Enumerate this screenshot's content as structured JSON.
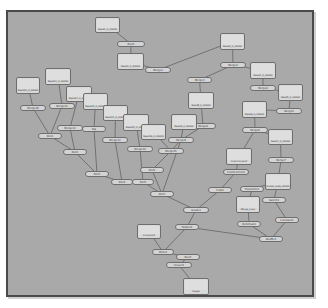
{
  "graph": {
    "title": "Node Graph",
    "background": "#a9a9a9",
    "node_fill": "#d6d6d6",
    "node_border": "#6e6e6e",
    "edge_color": "#5a5a5a",
    "nodes": [
      {
        "id": "r1",
        "type": "read",
        "label": "Read1_0_00000",
        "x": 95,
        "y": 17,
        "w": 25,
        "h": 16
      },
      {
        "id": "o1",
        "type": "op",
        "label": "Blur1",
        "x": 117,
        "y": 41,
        "w": 28,
        "h": 6
      },
      {
        "id": "r2",
        "type": "read",
        "label": "Read2_0_00000",
        "x": 117,
        "y": 53,
        "w": 27,
        "h": 17
      },
      {
        "id": "o2",
        "type": "op",
        "label": "Merge1",
        "x": 145,
        "y": 67,
        "w": 26,
        "h": 6
      },
      {
        "id": "r3",
        "type": "read",
        "label": "Read3_0_00000",
        "x": 220,
        "y": 33,
        "w": 25,
        "h": 17
      },
      {
        "id": "o3",
        "type": "op",
        "label": "Merge2",
        "x": 220,
        "y": 62,
        "w": 26,
        "h": 6
      },
      {
        "id": "o4",
        "type": "op",
        "label": "Merge3",
        "x": 187,
        "y": 77,
        "w": 25,
        "h": 6
      },
      {
        "id": "r4",
        "type": "read",
        "label": "Read4_0_00000",
        "x": 250,
        "y": 62,
        "w": 26,
        "h": 17
      },
      {
        "id": "o5",
        "type": "op",
        "label": "Merge4",
        "x": 250,
        "y": 85,
        "w": 26,
        "h": 6
      },
      {
        "id": "r5",
        "type": "read",
        "label": "Read5_0_00000",
        "x": 278,
        "y": 84,
        "w": 25,
        "h": 17
      },
      {
        "id": "o6",
        "type": "op",
        "label": "Merge5",
        "x": 276,
        "y": 108,
        "w": 26,
        "h": 6
      },
      {
        "id": "r6",
        "type": "read",
        "label": "Read6_0_00000",
        "x": 242,
        "y": 101,
        "w": 25,
        "h": 17
      },
      {
        "id": "o7",
        "type": "op",
        "label": "Merge6",
        "x": 242,
        "y": 127,
        "w": 26,
        "h": 6
      },
      {
        "id": "r7",
        "type": "read",
        "label": "Read7_0_00000",
        "x": 268,
        "y": 129,
        "w": 25,
        "h": 16
      },
      {
        "id": "o8",
        "type": "op",
        "label": "Merge7",
        "x": 268,
        "y": 157,
        "w": 26,
        "h": 6
      },
      {
        "id": "r8",
        "type": "read",
        "label": "Read8_0_00000",
        "x": 188,
        "y": 92,
        "w": 26,
        "h": 17
      },
      {
        "id": "o9",
        "type": "op",
        "label": "Merge8",
        "x": 190,
        "y": 123,
        "w": 26,
        "h": 6
      },
      {
        "id": "r9",
        "type": "read",
        "label": "Read9_0_00000",
        "x": 171,
        "y": 114,
        "w": 26,
        "h": 16
      },
      {
        "id": "o10",
        "type": "op",
        "label": "Merge9",
        "x": 168,
        "y": 137,
        "w": 26,
        "h": 6
      },
      {
        "id": "r10",
        "type": "read",
        "label": "Read10_0_00000",
        "x": 16,
        "y": 77,
        "w": 24,
        "h": 17
      },
      {
        "id": "o11",
        "type": "op",
        "label": "Merge10",
        "x": 20,
        "y": 105,
        "w": 26,
        "h": 6
      },
      {
        "id": "r11",
        "type": "read",
        "label": "Read11_0_00000",
        "x": 45,
        "y": 68,
        "w": 26,
        "h": 17
      },
      {
        "id": "o12",
        "type": "op",
        "label": "Merge11",
        "x": 49,
        "y": 103,
        "w": 26,
        "h": 6
      },
      {
        "id": "r12",
        "type": "read",
        "label": "Read12_0_00000",
        "x": 66,
        "y": 86,
        "w": 26,
        "h": 16
      },
      {
        "id": "o13",
        "type": "op",
        "label": "Merge12",
        "x": 57,
        "y": 125,
        "w": 26,
        "h": 6
      },
      {
        "id": "r13",
        "type": "read",
        "label": "Read13_0_00000",
        "x": 83,
        "y": 93,
        "w": 25,
        "h": 17
      },
      {
        "id": "o14",
        "type": "op",
        "label": "Tap",
        "x": 82,
        "y": 126,
        "w": 24,
        "h": 6
      },
      {
        "id": "r14",
        "type": "read",
        "label": "Read14_0_00000",
        "x": 103,
        "y": 105,
        "w": 25,
        "h": 16
      },
      {
        "id": "o15",
        "type": "op",
        "label": "Merge13",
        "x": 102,
        "y": 137,
        "w": 26,
        "h": 6
      },
      {
        "id": "r15",
        "type": "read",
        "label": "Read15_0_00000",
        "x": 123,
        "y": 114,
        "w": 26,
        "h": 17
      },
      {
        "id": "o16",
        "type": "op",
        "label": "Merge14",
        "x": 127,
        "y": 146,
        "w": 26,
        "h": 6
      },
      {
        "id": "r16",
        "type": "read",
        "label": "Read16_0_00000",
        "x": 141,
        "y": 124,
        "w": 25,
        "h": 16
      },
      {
        "id": "o17",
        "type": "op",
        "label": "Merge15",
        "x": 158,
        "y": 148,
        "w": 26,
        "h": 6
      },
      {
        "id": "o18",
        "type": "op",
        "label": "Dot1",
        "x": 38,
        "y": 133,
        "w": 24,
        "h": 6
      },
      {
        "id": "o19",
        "type": "op",
        "label": "Dot2",
        "x": 63,
        "y": 149,
        "w": 24,
        "h": 6
      },
      {
        "id": "o20",
        "type": "op",
        "label": "Dot3",
        "x": 85,
        "y": 171,
        "w": 24,
        "h": 6
      },
      {
        "id": "o21",
        "type": "op",
        "label": "Dot4",
        "x": 111,
        "y": 179,
        "w": 22,
        "h": 6
      },
      {
        "id": "o22",
        "type": "op",
        "label": "Dot5",
        "x": 132,
        "y": 179,
        "w": 22,
        "h": 6
      },
      {
        "id": "o23",
        "type": "op",
        "label": "Dot6",
        "x": 140,
        "y": 167,
        "w": 24,
        "h": 6
      },
      {
        "id": "o24",
        "type": "op",
        "label": "Dot7",
        "x": 150,
        "y": 191,
        "w": 24,
        "h": 6
      },
      {
        "id": "o25",
        "type": "op",
        "label": "Grade1",
        "x": 183,
        "y": 207,
        "w": 26,
        "h": 6
      },
      {
        "id": "o26",
        "type": "op",
        "label": "Crop1",
        "x": 208,
        "y": 187,
        "w": 24,
        "h": 6
      },
      {
        "id": "o27",
        "type": "op",
        "label": "ColorCorrect1",
        "x": 223,
        "y": 169,
        "w": 26,
        "h": 6
      },
      {
        "id": "r17",
        "type": "read",
        "label": "ColorCorrect2",
        "x": 226,
        "y": 148,
        "w": 26,
        "h": 17
      },
      {
        "id": "o28",
        "type": "op",
        "label": "Transform1",
        "x": 240,
        "y": 186,
        "w": 24,
        "h": 6
      },
      {
        "id": "r18",
        "type": "read",
        "label": "Grade_node_00000",
        "x": 265,
        "y": 173,
        "w": 26,
        "h": 17
      },
      {
        "id": "o29",
        "type": "op",
        "label": "Switch1",
        "x": 262,
        "y": 197,
        "w": 24,
        "h": 6
      },
      {
        "id": "r19",
        "type": "read",
        "label": "Merge_main",
        "x": 236,
        "y": 196,
        "w": 24,
        "h": 17
      },
      {
        "id": "o30",
        "type": "op",
        "label": "Reformat1",
        "x": 237,
        "y": 221,
        "w": 24,
        "h": 6
      },
      {
        "id": "o31",
        "type": "op",
        "label": "Constant1",
        "x": 275,
        "y": 217,
        "w": 24,
        "h": 6
      },
      {
        "id": "o32",
        "type": "op",
        "label": "Shuffle1",
        "x": 259,
        "y": 236,
        "w": 24,
        "h": 6
      },
      {
        "id": "o33",
        "type": "op",
        "label": "Output1",
        "x": 175,
        "y": 224,
        "w": 24,
        "h": 6
      },
      {
        "id": "r20",
        "type": "read",
        "label": "Constant2",
        "x": 137,
        "y": 224,
        "w": 24,
        "h": 15
      },
      {
        "id": "o34",
        "type": "op",
        "label": "Write1",
        "x": 152,
        "y": 249,
        "w": 22,
        "h": 6
      },
      {
        "id": "o35",
        "type": "op",
        "label": "Blur2",
        "x": 176,
        "y": 254,
        "w": 24,
        "h": 6
      },
      {
        "id": "o36",
        "type": "op",
        "label": "Viewer1",
        "x": 166,
        "y": 262,
        "w": 26,
        "h": 6
      },
      {
        "id": "r21",
        "type": "read",
        "label": "Viewer",
        "x": 183,
        "y": 278,
        "w": 26,
        "h": 17
      }
    ],
    "edges": [
      [
        "r1",
        "o1"
      ],
      [
        "o1",
        "r2"
      ],
      [
        "r2",
        "o2"
      ],
      [
        "o2",
        "r3"
      ],
      [
        "r3",
        "o3"
      ],
      [
        "o3",
        "o4"
      ],
      [
        "o4",
        "r8"
      ],
      [
        "o3",
        "r4"
      ],
      [
        "r4",
        "o5"
      ],
      [
        "o5",
        "r5"
      ],
      [
        "r5",
        "o6"
      ],
      [
        "o6",
        "r6"
      ],
      [
        "r6",
        "o7"
      ],
      [
        "o7",
        "r7"
      ],
      [
        "r7",
        "o8"
      ],
      [
        "r8",
        "o9"
      ],
      [
        "r9",
        "o10"
      ],
      [
        "o9",
        "o10"
      ],
      [
        "r10",
        "o11"
      ],
      [
        "r11",
        "o12"
      ],
      [
        "o11",
        "o18"
      ],
      [
        "o12",
        "o18"
      ],
      [
        "r12",
        "o13"
      ],
      [
        "o13",
        "o19"
      ],
      [
        "r13",
        "o14"
      ],
      [
        "o14",
        "o20"
      ],
      [
        "r14",
        "o15"
      ],
      [
        "o15",
        "o21"
      ],
      [
        "r15",
        "o16"
      ],
      [
        "o16",
        "o22"
      ],
      [
        "r16",
        "o17"
      ],
      [
        "o17",
        "o23"
      ],
      [
        "o18",
        "o19"
      ],
      [
        "o19",
        "o20"
      ],
      [
        "o20",
        "o21"
      ],
      [
        "o21",
        "o22"
      ],
      [
        "o22",
        "o24"
      ],
      [
        "o23",
        "o24"
      ],
      [
        "o10",
        "o24"
      ],
      [
        "o24",
        "o25"
      ],
      [
        "o26",
        "o25"
      ],
      [
        "o27",
        "o26"
      ],
      [
        "r17",
        "o27"
      ],
      [
        "o8",
        "r18"
      ],
      [
        "r18",
        "o28"
      ],
      [
        "o28",
        "r19"
      ],
      [
        "r18",
        "o29"
      ],
      [
        "o29",
        "o31"
      ],
      [
        "r19",
        "o30"
      ],
      [
        "o30",
        "o32"
      ],
      [
        "o31",
        "o32"
      ],
      [
        "o32",
        "o33"
      ],
      [
        "o25",
        "o33"
      ],
      [
        "o33",
        "o34"
      ],
      [
        "r20",
        "o34"
      ],
      [
        "o34",
        "o35"
      ],
      [
        "o35",
        "o36"
      ],
      [
        "o36",
        "r21"
      ],
      [
        "o7",
        "r17"
      ],
      [
        "o10",
        "o17"
      ]
    ]
  }
}
